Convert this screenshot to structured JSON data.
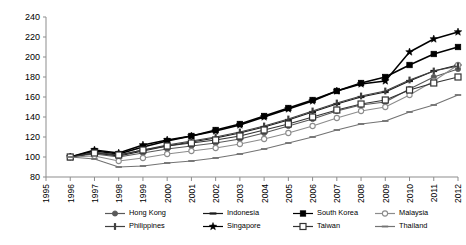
{
  "chart_data": {
    "type": "line",
    "title": "",
    "xlabel": "",
    "ylabel": "",
    "xlim": [
      1995,
      2012
    ],
    "ylim": [
      80,
      240
    ],
    "yticks": [
      80,
      100,
      120,
      140,
      160,
      180,
      200,
      220,
      240
    ],
    "grid": false,
    "legend_position": "bottom",
    "x": [
      1996,
      1997,
      1998,
      1999,
      2000,
      2001,
      2002,
      2003,
      2004,
      2005,
      2006,
      2007,
      2008,
      2009,
      2010,
      2011,
      2012
    ],
    "series": [
      {
        "name": "Hong Kong",
        "marker": "filled-circle",
        "color": "#595959",
        "values": [
          100,
          103,
          100,
          104,
          108,
          111,
          114,
          118,
          124,
          131,
          138,
          146,
          152,
          155,
          168,
          180,
          188
        ]
      },
      {
        "name": "Indonesia",
        "marker": "horizontal-dash",
        "color": "#1a1a1a",
        "values": [
          100,
          104,
          101,
          106,
          111,
          115,
          119,
          124,
          130,
          137,
          145,
          153,
          160,
          165,
          176,
          186,
          192
        ]
      },
      {
        "name": "South Korea",
        "marker": "filled-square",
        "color": "#000000",
        "values": [
          100,
          106,
          103,
          110,
          116,
          121,
          127,
          133,
          141,
          149,
          157,
          166,
          174,
          180,
          192,
          203,
          210
        ]
      },
      {
        "name": "Malaysia",
        "marker": "open-circle",
        "color": "#8c8c8c",
        "values": [
          100,
          101,
          96,
          99,
          103,
          106,
          109,
          113,
          118,
          124,
          131,
          139,
          146,
          150,
          162,
          176,
          192
        ]
      },
      {
        "name": "Philippines",
        "marker": "vertical-bar",
        "color": "#404040",
        "values": [
          100,
          105,
          102,
          107,
          112,
          116,
          120,
          125,
          131,
          138,
          146,
          154,
          161,
          166,
          177,
          186,
          191
        ]
      },
      {
        "name": "Singapore",
        "marker": "star",
        "color": "#000000",
        "values": [
          100,
          107,
          104,
          112,
          117,
          121,
          126,
          132,
          140,
          148,
          156,
          166,
          173,
          176,
          205,
          218,
          225
        ]
      },
      {
        "name": "Taiwan",
        "marker": "open-square",
        "color": "#333333",
        "values": [
          100,
          104,
          102,
          107,
          111,
          114,
          117,
          121,
          127,
          133,
          140,
          147,
          153,
          157,
          167,
          174,
          180
        ]
      },
      {
        "name": "Thailand",
        "marker": "horizontal-line",
        "color": "#737373",
        "values": [
          100,
          98,
          90,
          91,
          94,
          96,
          99,
          103,
          108,
          114,
          120,
          127,
          133,
          136,
          145,
          152,
          162
        ]
      }
    ]
  },
  "axis": {
    "ytick_labels": [
      "240",
      "220",
      "200",
      "180",
      "160",
      "140",
      "120",
      "100",
      "80"
    ],
    "xtick_labels": [
      "1995",
      "1996",
      "1997",
      "1998",
      "1999",
      "2000",
      "2001",
      "2002",
      "2003",
      "2004",
      "2005",
      "2006",
      "2007",
      "2008",
      "2009",
      "2010",
      "2011",
      "2012"
    ]
  },
  "legend": {
    "items": [
      {
        "label": "Hong Kong",
        "marker": "filled-circle"
      },
      {
        "label": "Indonesia",
        "marker": "horizontal-dash"
      },
      {
        "label": "South Korea",
        "marker": "filled-square"
      },
      {
        "label": "Malaysia",
        "marker": "open-circle"
      },
      {
        "label": "Philippines",
        "marker": "vertical-bar"
      },
      {
        "label": "Singapore",
        "marker": "star"
      },
      {
        "label": "Taiwan",
        "marker": "open-square"
      },
      {
        "label": "Thailand",
        "marker": "horizontal-line"
      }
    ]
  }
}
